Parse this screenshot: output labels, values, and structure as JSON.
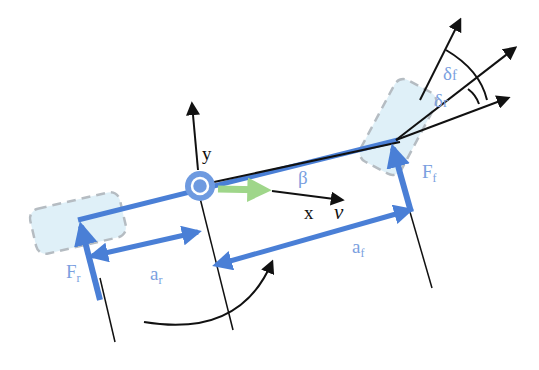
{
  "diagram": {
    "colors": {
      "body_blue": "#4a7fd6",
      "label_blue": "#7b9fe0",
      "wheel_fill": "#dff0f8",
      "wheel_dash": "#b5bcc2",
      "velocity_green": "#9fd68a",
      "black": "#111111"
    },
    "labels": {
      "y_axis": "y",
      "x_axis": "x",
      "velocity": "v",
      "sideslip": "β",
      "front_force_main": "F",
      "front_force_sub": "f",
      "rear_force_main": "F",
      "rear_force_sub": "r",
      "front_distance_main": "a",
      "front_distance_sub": "f",
      "rear_distance_main": "a",
      "rear_distance_sub": "r",
      "front_steer_main": "δ",
      "front_steer_sub": "f",
      "rear_steer_main": "δ",
      "rear_steer_sub": "r"
    },
    "nodes": [
      {
        "id": "cg",
        "label": "center of gravity"
      },
      {
        "id": "front-wheel",
        "label": "front wheel"
      },
      {
        "id": "rear-wheel",
        "label": "rear wheel"
      }
    ],
    "edges": [
      {
        "from": "cg",
        "to": "front-wheel",
        "label": "a_f"
      },
      {
        "from": "rear-wheel",
        "to": "cg",
        "label": "a_r"
      }
    ]
  }
}
